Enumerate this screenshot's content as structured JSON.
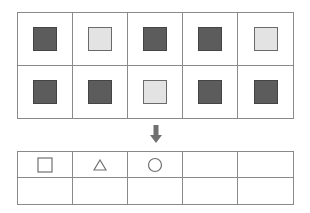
{
  "top_grid": {
    "rows": 2,
    "cols": 5,
    "cells": [
      [
        "dark",
        "light",
        "dark",
        "dark",
        "light"
      ],
      [
        "dark",
        "dark",
        "light",
        "dark",
        "dark"
      ]
    ]
  },
  "arrow": {
    "direction": "down",
    "icon": "arrow-down-icon",
    "color": "#707070"
  },
  "bottom_grid": {
    "rows": 2,
    "cols": 5,
    "cells": [
      [
        "square",
        "triangle",
        "circle",
        "",
        ""
      ],
      [
        "",
        "",
        "",
        "",
        ""
      ]
    ]
  },
  "colors": {
    "dark_square": "#5c5c5c",
    "light_square": "#e3e3e3",
    "grid_line": "#8a8a8a"
  }
}
